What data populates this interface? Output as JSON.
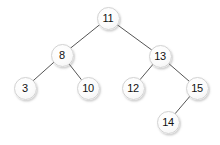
{
  "diagram": {
    "background_color": "#ffffff",
    "node_fill_color": "#f7f7f7",
    "node_border_color": "#d2d2d2",
    "node_text_color": "#111111",
    "edge_color": "#555555",
    "edge_width": 1,
    "node_diameter": 23,
    "canvas": {
      "width": 220,
      "height": 145
    }
  },
  "chart_data": {
    "type": "diagram",
    "title": "",
    "nodes": [
      {
        "id": "n11",
        "label": "11",
        "x": 108,
        "y": 18,
        "depth": 0
      },
      {
        "id": "n8",
        "label": "8",
        "x": 62,
        "y": 55,
        "depth": 1
      },
      {
        "id": "n13",
        "label": "13",
        "x": 160,
        "y": 56,
        "depth": 1
      },
      {
        "id": "n3",
        "label": "3",
        "x": 25,
        "y": 88,
        "depth": 2
      },
      {
        "id": "n10",
        "label": "10",
        "x": 88,
        "y": 88,
        "depth": 2
      },
      {
        "id": "n12",
        "label": "12",
        "x": 133,
        "y": 88,
        "depth": 2
      },
      {
        "id": "n15",
        "label": "15",
        "x": 197,
        "y": 88,
        "depth": 2
      },
      {
        "id": "n14",
        "label": "14",
        "x": 168,
        "y": 122,
        "depth": 3
      }
    ],
    "edges": [
      {
        "from": "n11",
        "to": "n8",
        "x1": 108,
        "y1": 18,
        "x2": 62,
        "y2": 55
      },
      {
        "from": "n11",
        "to": "n13",
        "x1": 108,
        "y1": 18,
        "x2": 160,
        "y2": 56
      },
      {
        "from": "n8",
        "to": "n3",
        "x1": 62,
        "y1": 55,
        "x2": 25,
        "y2": 88
      },
      {
        "from": "n8",
        "to": "n10",
        "x1": 62,
        "y1": 55,
        "x2": 88,
        "y2": 88
      },
      {
        "from": "n13",
        "to": "n12",
        "x1": 160,
        "y1": 56,
        "x2": 133,
        "y2": 88
      },
      {
        "from": "n13",
        "to": "n15",
        "x1": 160,
        "y1": 56,
        "x2": 197,
        "y2": 88
      },
      {
        "from": "n15",
        "to": "n14",
        "x1": 197,
        "y1": 88,
        "x2": 168,
        "y2": 122
      }
    ]
  }
}
